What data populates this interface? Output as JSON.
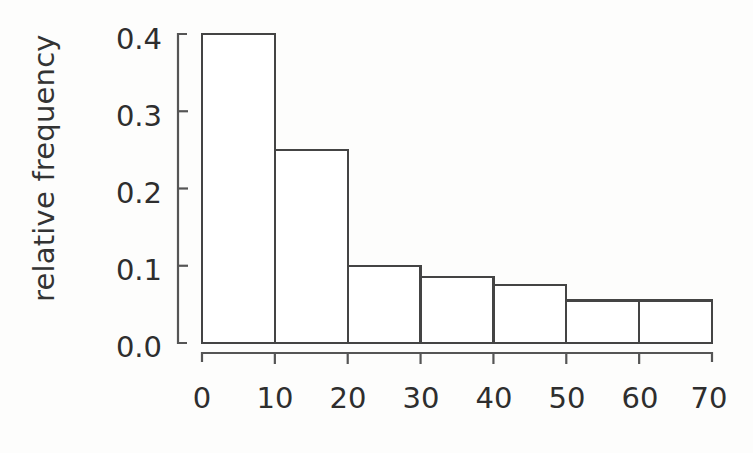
{
  "chart_data": {
    "type": "bar",
    "title": "",
    "subtitle": "",
    "xlabel": "",
    "ylabel": "relative frequency",
    "bin_width": 10,
    "bin_edges": [
      0,
      10,
      20,
      30,
      40,
      50,
      60,
      70
    ],
    "categories": [
      "0-10",
      "10-20",
      "20-30",
      "30-40",
      "40-50",
      "50-60",
      "60-70"
    ],
    "values": [
      0.4,
      0.25,
      0.1,
      0.085,
      0.075,
      0.055,
      0.055
    ],
    "xlim": [
      0,
      70
    ],
    "ylim": [
      0.0,
      0.4
    ],
    "xticks": [
      0,
      10,
      20,
      30,
      40,
      50,
      60,
      70
    ],
    "yticks": [
      0.0,
      0.1,
      0.2,
      0.3,
      0.4
    ],
    "xtick_labels": [
      "0",
      "10",
      "20",
      "30",
      "40",
      "50",
      "60",
      "70"
    ],
    "ytick_labels": [
      "0.0",
      "0.1",
      "0.2",
      "0.3",
      "0.4"
    ],
    "grid": false,
    "legend": null,
    "legend_position": "none",
    "bar_fill": "#ffffff",
    "bar_stroke": "#444444",
    "axis_color": "#555555",
    "background": "#fdfdfc"
  },
  "axes": {
    "y_label_text": "relative frequency",
    "y_tick_0": "0.0",
    "y_tick_1": "0.1",
    "y_tick_2": "0.2",
    "y_tick_3": "0.3",
    "y_tick_4": "0.4",
    "x_tick_0": "0",
    "x_tick_1": "10",
    "x_tick_2": "20",
    "x_tick_3": "30",
    "x_tick_4": "40",
    "x_tick_5": "50",
    "x_tick_6": "60",
    "x_tick_7": "70"
  }
}
